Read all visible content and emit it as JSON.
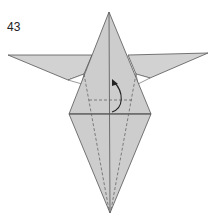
{
  "diagram": {
    "step_number": "43",
    "colors": {
      "paper": "#cfcfcf",
      "paper_light": "#dcdcdc",
      "line": "#555555",
      "dashed": "#666666",
      "arrow": "#222222"
    }
  }
}
